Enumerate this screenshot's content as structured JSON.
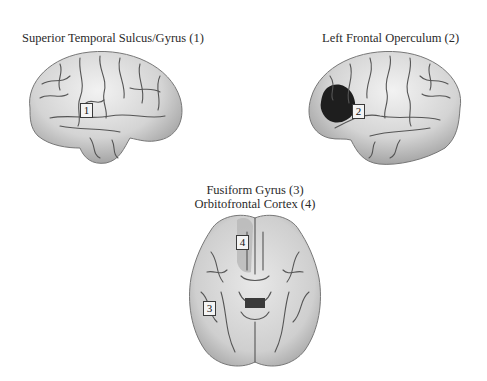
{
  "figure": {
    "panels": [
      {
        "id": "lateral-right",
        "title": "Superior Temporal Sulcus/Gyrus (1)",
        "view": "lateral view",
        "markers": [
          {
            "label": "1",
            "region": "Superior Temporal Sulcus/Gyrus"
          }
        ]
      },
      {
        "id": "lateral-left",
        "title": "Left Frontal Operculum (2)",
        "view": "lateral view",
        "markers": [
          {
            "label": "2",
            "region": "Left Frontal Operculum",
            "highlight_color": "#1e1e1e"
          }
        ]
      },
      {
        "id": "ventral",
        "title_line1": "Fusiform Gyrus (3)",
        "title_line2": "Orbitofrontal Cortex (4)",
        "view": "ventral view",
        "markers": [
          {
            "label": "3",
            "region": "Fusiform Gyrus"
          },
          {
            "label": "4",
            "region": "Orbitofrontal Cortex"
          }
        ]
      }
    ],
    "colors": {
      "background": "#ffffff",
      "brain_fill": "#d9d9d9",
      "brain_shadow": "#8a8a8a",
      "sulcus": "#4a4a4a",
      "highlight": "#1e1e1e"
    }
  }
}
